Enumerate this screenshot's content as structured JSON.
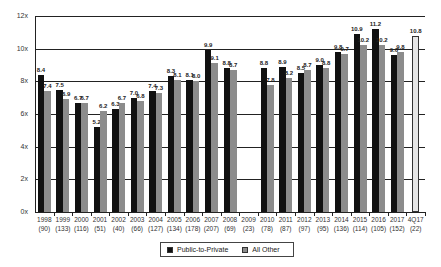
{
  "chart_data": {
    "type": "bar",
    "title": "",
    "xlabel": "",
    "ylabel": "",
    "ylim": [
      0,
      12
    ],
    "yticks": [
      "0x",
      "2x",
      "4x",
      "6x",
      "8x",
      "10x",
      "12x"
    ],
    "grid": true,
    "legend_position": "bottom",
    "categories": [
      "1998",
      "1999",
      "2000",
      "2001",
      "2002",
      "2003",
      "2004",
      "2005",
      "2006",
      "2007",
      "2008",
      "2009",
      "2010",
      "2011",
      "2012",
      "2013",
      "2014",
      "2015",
      "2016",
      "2017",
      "4Q17"
    ],
    "category_counts": [
      "(90)",
      "(133)",
      "(116)",
      "(51)",
      "(40)",
      "(66)",
      "(127)",
      "(134)",
      "(178)",
      "(207)",
      "(69)",
      "(23)",
      "(78)",
      "(87)",
      "(97)",
      "(95)",
      "(136)",
      "(114)",
      "(105)",
      "(152)",
      "(22)"
    ],
    "series": [
      {
        "name": "Public-to-Private",
        "color": "#111111",
        "values": [
          8.4,
          7.5,
          6.7,
          5.2,
          6.3,
          7.0,
          7.4,
          8.3,
          8.1,
          9.9,
          8.8,
          null,
          8.8,
          8.9,
          8.5,
          9.0,
          9.8,
          10.9,
          11.2,
          9.6,
          null
        ]
      },
      {
        "name": "All Other",
        "color": "#8c8c8c",
        "values": [
          7.4,
          6.9,
          6.7,
          6.2,
          6.7,
          6.8,
          7.3,
          8.1,
          8.0,
          9.1,
          8.7,
          null,
          7.8,
          8.2,
          8.7,
          8.8,
          9.7,
          10.2,
          10.2,
          9.8,
          null
        ]
      },
      {
        "name": "4Q17",
        "color": "#e6e6e6",
        "values": [
          null,
          null,
          null,
          null,
          null,
          null,
          null,
          null,
          null,
          null,
          null,
          null,
          null,
          null,
          null,
          null,
          null,
          null,
          null,
          null,
          10.8
        ]
      }
    ]
  },
  "legend": {
    "items": [
      {
        "label": "Public-to-Private",
        "color": "#111111"
      },
      {
        "label": "All Other",
        "color": "#8c8c8c"
      }
    ]
  }
}
